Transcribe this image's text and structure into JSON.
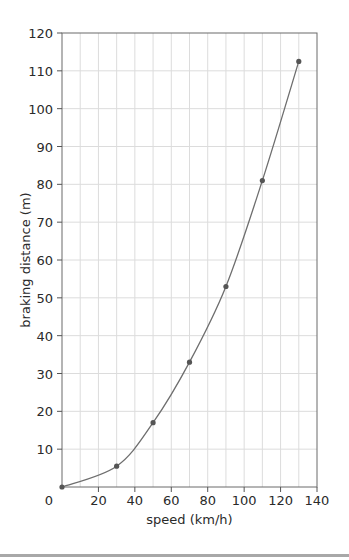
{
  "chart_data": {
    "type": "line",
    "title": "",
    "xlabel": "speed (km/h)",
    "ylabel": "braking distance (m)",
    "xlim": [
      0,
      140
    ],
    "ylim": [
      0,
      120
    ],
    "xticks": [
      0,
      20,
      40,
      60,
      80,
      100,
      120,
      140
    ],
    "yticks": [
      10,
      20,
      30,
      40,
      50,
      60,
      70,
      80,
      90,
      100,
      110,
      120
    ],
    "grid": true,
    "grid_x_step": 10,
    "grid_y_step": 10,
    "legend": null,
    "series": [
      {
        "name": "braking distance",
        "x": [
          0,
          30,
          50,
          70,
          90,
          110,
          130
        ],
        "y": [
          0,
          5.5,
          17,
          33,
          53,
          81,
          112.5
        ],
        "marker": "dot",
        "smooth": true
      }
    ],
    "colors": {
      "line": "#6e6e6e",
      "marker": "#555555",
      "grid": "#dcdcdc",
      "axis": "#555555"
    }
  },
  "labels": {
    "x_axis": "speed (km/h)",
    "y_axis": "braking distance (m)",
    "x_ticks": [
      "0",
      "20",
      "40",
      "60",
      "80",
      "100",
      "120",
      "140"
    ],
    "y_ticks": [
      "10",
      "20",
      "30",
      "40",
      "50",
      "60",
      "70",
      "80",
      "90",
      "100",
      "110",
      "120"
    ]
  }
}
